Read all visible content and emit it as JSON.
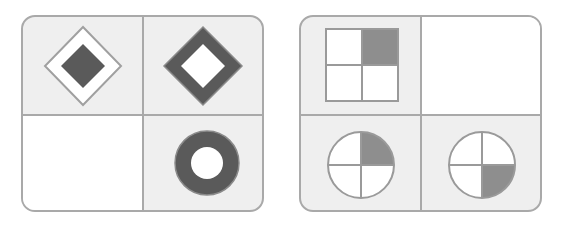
{
  "puzzle": {
    "colors": {
      "panel_background": "#efefef",
      "blank_cell": "#ffffff",
      "border": "#a9a9a9",
      "shape_dark": "#5a5a5a",
      "shape_shaded": "#8e8e8e",
      "shape_light": "#ffffff"
    },
    "panels": [
      {
        "name": "left",
        "cells": [
          {
            "position": "top-left",
            "shape": "diamond-outline-white-with-dark-inner-diamond",
            "icon": "diamond-filled-inner-icon"
          },
          {
            "position": "top-right",
            "shape": "dark-diamond-ring-with-white-center",
            "icon": "diamond-ring-icon"
          },
          {
            "position": "bottom-left",
            "shape": "blank",
            "icon": "empty-cell"
          },
          {
            "position": "bottom-right",
            "shape": "dark-circle-ring-with-white-center",
            "icon": "circle-ring-icon"
          }
        ]
      },
      {
        "name": "right",
        "cells": [
          {
            "position": "top-left",
            "shape": "square-quartered-top-right-shaded",
            "icon": "quartered-square-icon",
            "shaded_quadrant": "top-right"
          },
          {
            "position": "top-right",
            "shape": "blank",
            "icon": "empty-cell"
          },
          {
            "position": "bottom-left",
            "shape": "circle-quartered-top-right-shaded",
            "icon": "quartered-circle-icon",
            "shaded_quadrant": "top-right"
          },
          {
            "position": "bottom-right",
            "shape": "circle-quartered-bottom-right-shaded",
            "icon": "quartered-circle-icon",
            "shaded_quadrant": "bottom-right"
          }
        ]
      }
    ]
  }
}
